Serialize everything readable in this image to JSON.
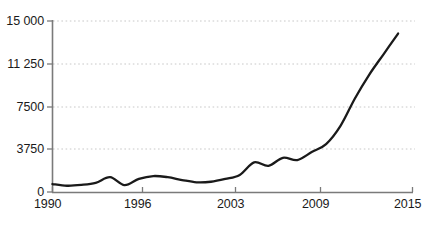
{
  "chart_data": {
    "type": "line",
    "title": "",
    "subtitle": "",
    "xlabel": "",
    "ylabel": "",
    "xlim": [
      1990,
      2015
    ],
    "ylim": [
      0,
      15000
    ],
    "grid": true,
    "grid_axis": "y",
    "legend": null,
    "legend_position": "none",
    "y_ticks": [
      0,
      3750,
      7500,
      11250,
      15000
    ],
    "y_tick_labels": [
      "0",
      "3750",
      "7500",
      "11 250",
      "15 000"
    ],
    "x_ticks": [
      1990,
      1996,
      2003,
      2009,
      2015
    ],
    "x_tick_labels": [
      "1990",
      "1996",
      "2003",
      "2009",
      "2015"
    ],
    "series": [
      {
        "name": "series-1",
        "color": "#1a1a1a",
        "x": [
          1990,
          1991,
          1992,
          1993,
          1994,
          1995,
          1996,
          1997,
          1998,
          1999,
          2000,
          2001,
          2002,
          2003,
          2004,
          2005,
          2006,
          2007,
          2008,
          2009,
          2010,
          2011,
          2012,
          2013,
          2014
        ],
        "values": [
          700,
          550,
          620,
          800,
          1300,
          600,
          1150,
          1400,
          1300,
          1050,
          850,
          900,
          1150,
          1500,
          2600,
          2300,
          3000,
          2800,
          3500,
          4200,
          5800,
          8200,
          10300,
          12100,
          13900
        ]
      }
    ]
  },
  "axes": {
    "y_axis_color": "#808080",
    "x_axis_color": "#808080",
    "gridline_color": "#c8c8c8",
    "tick_text_color": "#1a1a1a"
  }
}
